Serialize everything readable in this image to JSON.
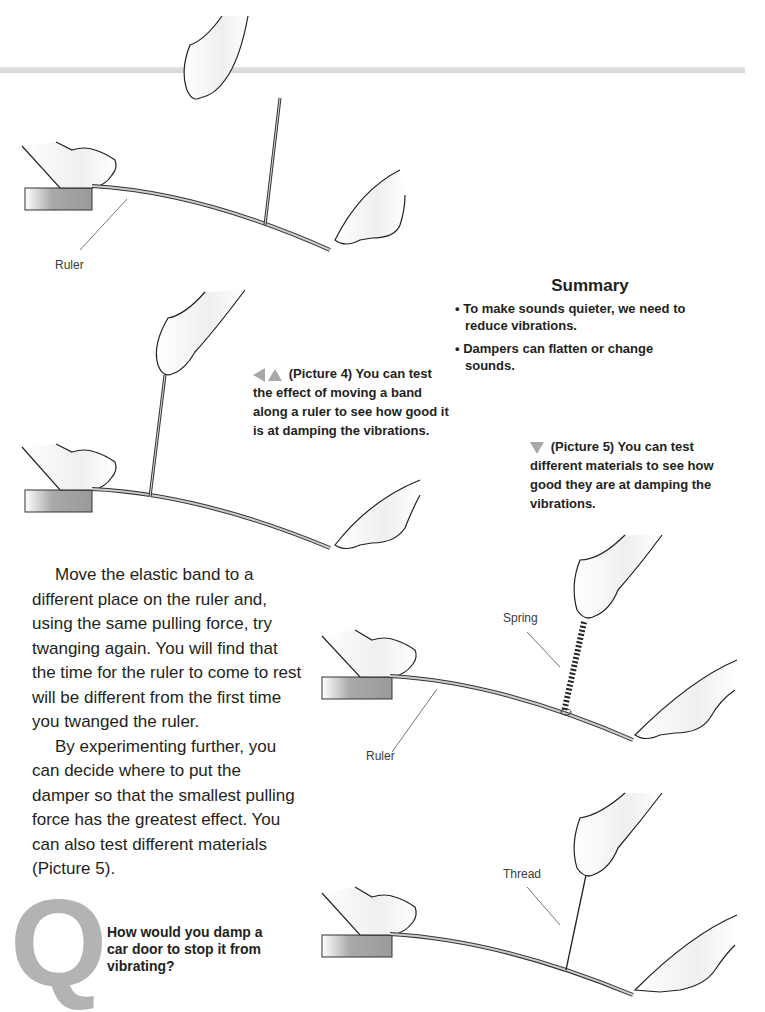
{
  "illustrations": [
    {
      "id": "picture-3",
      "labels": [
        {
          "text": "Ruler"
        }
      ]
    },
    {
      "id": "picture-4",
      "labels": []
    },
    {
      "id": "picture-5-spring",
      "labels": [
        {
          "text": "Spring"
        },
        {
          "text": "Ruler"
        }
      ]
    },
    {
      "id": "picture-5-thread",
      "labels": [
        {
          "text": "Thread"
        }
      ]
    }
  ],
  "summary": {
    "title": "Summary",
    "items": [
      "To make sounds quieter, we need to reduce vibrations.",
      "Dampers can flatten or change sounds."
    ]
  },
  "captions": {
    "picture4": {
      "arrows": [
        "triangle-left-icon",
        "triangle-up-icon"
      ],
      "text": "(Picture 4) You can test the effect of moving a band along a ruler to see how good it is at damping the vibrations."
    },
    "picture5": {
      "arrows": [
        "triangle-down-icon"
      ],
      "text": "(Picture 5) You can test different materials to see how good they are at damping the vibrations."
    }
  },
  "body": {
    "paragraphs": [
      "Move the elastic band to a different place on the ruler and, using the same pulling force, try twanging again. You will find that the time for the ruler to come to rest will be different from the first time you twanged the ruler.",
      "By experimenting further, you can decide where to put the damper so that the smallest pulling force has the greatest effect. You can also test different materials (Picture 5)."
    ]
  },
  "question": {
    "letter": "Q",
    "text": "How would you damp a car door to stop it from vibrating?"
  },
  "colors": {
    "accent_gray": "#a8a8a8",
    "q_gray": "#b3b3b3",
    "text": "#231f20",
    "bench_gray": "#999999"
  }
}
